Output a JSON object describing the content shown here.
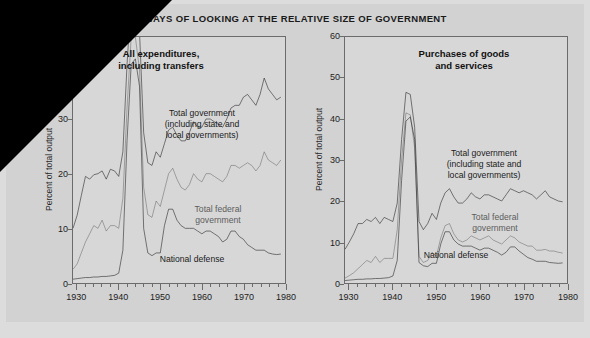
{
  "figure": {
    "title": "TWO WAYS OF LOOKING AT THE RELATIVE SIZE OF GOVERNMENT",
    "background_color": "#d2d2d2",
    "plot_background_color": "#d7d7d7",
    "line_color": "#1a1a1a",
    "gray_line_color": "#6a6a6a"
  },
  "chart_data": [
    {
      "type": "line",
      "title": "All expenditures,\nincluding transfers",
      "xlabel": "",
      "ylabel": "Percent of total output",
      "xlim": [
        1929,
        1980
      ],
      "ylim": [
        0,
        45
      ],
      "yticks": [
        0,
        10,
        20,
        30,
        40
      ],
      "xticks": [
        1930,
        1940,
        1950,
        1960,
        1970,
        1980
      ],
      "minor_xtick_interval": 2,
      "grid": false,
      "legend": "inline annotations",
      "annotations": [
        "Total government\n(including state and\nlocal governments)",
        "Total federal\ngovernment",
        "National defense"
      ],
      "note": "Wartime peaks extend above the top of the visible axis.",
      "x": [
        1929,
        1930,
        1931,
        1932,
        1933,
        1934,
        1935,
        1936,
        1937,
        1938,
        1939,
        1940,
        1941,
        1942,
        1943,
        1944,
        1945,
        1946,
        1947,
        1948,
        1949,
        1950,
        1951,
        1952,
        1953,
        1954,
        1955,
        1956,
        1957,
        1958,
        1959,
        1960,
        1961,
        1962,
        1963,
        1964,
        1965,
        1966,
        1967,
        1968,
        1969,
        1970,
        1971,
        1972,
        1973,
        1974,
        1975,
        1976,
        1977,
        1978,
        1979
      ],
      "series": [
        {
          "name": "Total government (including state and local governments)",
          "color": "#1a1a1a",
          "values": [
            10.0,
            12.4,
            16.0,
            19.5,
            19.0,
            19.8,
            20.0,
            20.5,
            19.0,
            20.8,
            20.5,
            19.5,
            24.0,
            40.0,
            52.0,
            52.0,
            46.0,
            27.5,
            22.0,
            21.5,
            24.0,
            23.0,
            25.5,
            28.0,
            28.5,
            27.0,
            26.0,
            26.0,
            27.5,
            29.5,
            28.5,
            28.5,
            30.0,
            30.0,
            29.5,
            29.0,
            28.5,
            30.0,
            32.0,
            32.5,
            32.5,
            34.0,
            34.5,
            33.5,
            32.5,
            34.5,
            37.5,
            35.5,
            34.5,
            33.5,
            34.0
          ]
        },
        {
          "name": "Total federal government",
          "color": "#6a6a6a",
          "values": [
            2.5,
            3.5,
            5.5,
            7.5,
            9.0,
            10.5,
            10.0,
            11.5,
            9.5,
            10.5,
            10.5,
            10.0,
            15.5,
            32.0,
            45.0,
            45.0,
            39.0,
            17.5,
            12.5,
            12.0,
            15.0,
            14.0,
            17.0,
            20.0,
            21.0,
            19.0,
            17.5,
            17.0,
            18.0,
            20.0,
            19.0,
            18.5,
            20.0,
            20.0,
            19.5,
            19.0,
            18.5,
            19.5,
            21.5,
            21.5,
            21.0,
            21.5,
            22.0,
            21.5,
            20.5,
            21.5,
            24.0,
            22.5,
            22.0,
            21.5,
            22.5
          ]
        },
        {
          "name": "National defense",
          "color": "#1a1a1a",
          "values": [
            0.7,
            0.8,
            0.9,
            1.0,
            1.0,
            1.1,
            1.1,
            1.2,
            1.2,
            1.3,
            1.4,
            1.8,
            6.0,
            26.0,
            40.0,
            41.0,
            36.0,
            10.0,
            5.5,
            5.0,
            5.5,
            5.5,
            10.5,
            13.5,
            13.5,
            11.5,
            10.5,
            10.0,
            10.0,
            10.0,
            9.5,
            9.0,
            9.5,
            9.5,
            9.0,
            8.5,
            7.5,
            8.0,
            9.5,
            9.5,
            8.5,
            8.0,
            7.0,
            6.5,
            6.0,
            6.0,
            6.0,
            5.5,
            5.3,
            5.2,
            5.3
          ]
        }
      ]
    },
    {
      "type": "line",
      "title": "Purchases of goods\nand services",
      "xlabel": "",
      "ylabel": "Percent of total output",
      "xlim": [
        1929,
        1980
      ],
      "ylim": [
        0,
        60
      ],
      "yticks": [
        0,
        10,
        20,
        30,
        40,
        50,
        60
      ],
      "xticks": [
        1930,
        1940,
        1950,
        1960,
        1970,
        1980
      ],
      "minor_xtick_interval": 2,
      "grid": false,
      "legend": "inline annotations",
      "annotations": [
        "Total government\n(including state and\nlocal governments)",
        "Total federal\ngovernment",
        "National defense"
      ],
      "x": [
        1929,
        1930,
        1931,
        1932,
        1933,
        1934,
        1935,
        1936,
        1937,
        1938,
        1939,
        1940,
        1941,
        1942,
        1943,
        1944,
        1945,
        1946,
        1947,
        1948,
        1949,
        1950,
        1951,
        1952,
        1953,
        1954,
        1955,
        1956,
        1957,
        1958,
        1959,
        1960,
        1961,
        1962,
        1963,
        1964,
        1965,
        1966,
        1967,
        1968,
        1969,
        1970,
        1971,
        1972,
        1973,
        1974,
        1975,
        1976,
        1977,
        1978,
        1979
      ],
      "series": [
        {
          "name": "Total government (including state and local governments)",
          "color": "#1a1a1a",
          "values": [
            8.2,
            10.0,
            12.0,
            14.5,
            14.5,
            15.5,
            15.0,
            16.0,
            14.5,
            16.0,
            15.5,
            15.0,
            19.5,
            35.0,
            46.5,
            46.0,
            38.0,
            15.0,
            13.0,
            14.5,
            17.0,
            15.5,
            19.5,
            22.0,
            23.0,
            21.0,
            19.5,
            19.5,
            20.5,
            22.0,
            21.0,
            20.5,
            21.5,
            21.5,
            21.0,
            20.5,
            20.0,
            21.5,
            23.0,
            22.5,
            22.0,
            22.5,
            22.0,
            21.5,
            20.5,
            21.5,
            22.5,
            21.0,
            20.5,
            20.0,
            19.8
          ]
        },
        {
          "name": "Total federal government",
          "color": "#6a6a6a",
          "values": [
            1.2,
            1.8,
            2.5,
            3.5,
            4.5,
            5.5,
            5.0,
            6.5,
            5.0,
            6.0,
            6.0,
            6.0,
            13.0,
            30.0,
            41.5,
            41.0,
            33.0,
            6.5,
            5.0,
            5.5,
            7.5,
            6.5,
            11.0,
            14.0,
            14.5,
            12.0,
            10.5,
            10.0,
            10.5,
            11.5,
            11.0,
            10.5,
            11.0,
            11.5,
            10.5,
            10.0,
            9.5,
            10.5,
            11.5,
            11.0,
            10.0,
            9.5,
            9.0,
            9.0,
            8.0,
            8.0,
            8.2,
            7.8,
            7.8,
            7.5,
            7.3
          ]
        },
        {
          "name": "National defense",
          "color": "#1a1a1a",
          "values": [
            0.6,
            0.7,
            0.8,
            0.9,
            0.9,
            1.0,
            1.0,
            1.1,
            1.1,
            1.2,
            1.3,
            1.7,
            5.5,
            25.0,
            39.5,
            40.5,
            35.0,
            5.0,
            4.2,
            4.0,
            4.8,
            4.8,
            9.5,
            12.5,
            12.5,
            10.5,
            9.5,
            9.0,
            9.0,
            9.0,
            8.5,
            8.0,
            8.5,
            8.5,
            8.0,
            7.5,
            6.8,
            7.5,
            8.8,
            8.8,
            7.8,
            7.0,
            6.2,
            5.8,
            5.3,
            5.3,
            5.3,
            5.0,
            4.9,
            4.8,
            4.9
          ]
        }
      ]
    }
  ]
}
